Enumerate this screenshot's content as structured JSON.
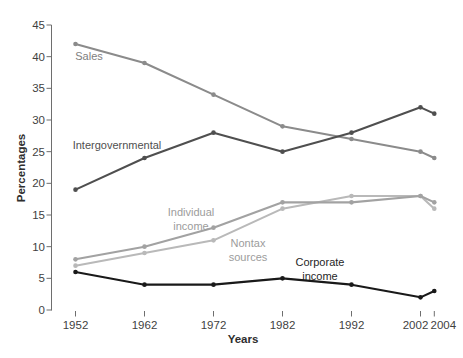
{
  "figure": {
    "background_color": "#ffffff",
    "width_px": 463,
    "height_px": 358
  },
  "chart_data": {
    "type": "line",
    "title": "",
    "xlabel": "Years",
    "ylabel": "Percentages",
    "x": [
      1952,
      1962,
      1972,
      1982,
      1992,
      2002,
      2004
    ],
    "x_tick_labels": [
      "1952",
      "1962",
      "1972",
      "1982",
      "1992",
      "2002",
      "2004"
    ],
    "x_label_dx": [
      0,
      0,
      0,
      0,
      0,
      -5,
      9
    ],
    "y_tick_labels": [
      "0",
      "5",
      "10",
      "15",
      "20",
      "25",
      "30",
      "35",
      "40",
      "45"
    ],
    "ylim": [
      0,
      45
    ],
    "ytick_step": 5,
    "grid": false,
    "legend_position": "inline-labels",
    "marker": "dot",
    "series": [
      {
        "name": "Sales",
        "values": [
          42,
          39,
          34,
          29,
          27,
          25,
          24
        ],
        "color": "#8b8b8b"
      },
      {
        "name": "Nontax sources",
        "values": [
          7,
          9,
          11,
          16,
          18,
          18,
          16
        ],
        "color": "#b9b9b9"
      },
      {
        "name": "Individual income",
        "values": [
          8,
          10,
          13,
          17,
          17,
          18,
          17
        ],
        "color": "#a2a2a2"
      },
      {
        "name": "Intergovernmental",
        "values": [
          19,
          24,
          28,
          25,
          28,
          32,
          31
        ],
        "color": "#4f4f4f"
      },
      {
        "name": "Corporate income",
        "values": [
          6,
          4,
          4,
          5,
          4,
          2,
          3
        ],
        "color": "#191919"
      }
    ],
    "annotations": [
      {
        "text": "Sales",
        "x": 89,
        "y": 56,
        "color": "#7e7e7e"
      },
      {
        "text": "Intergovernmental",
        "x": 117,
        "y": 145,
        "color": "#4f4f4f"
      },
      {
        "text": "Individual\nincome",
        "x": 191,
        "y": 212,
        "color": "#9c9c9c"
      },
      {
        "text": "Nontax\nsources",
        "x": 248,
        "y": 243,
        "color": "#9c9c9c"
      },
      {
        "text": "Corporate\nincome",
        "x": 320,
        "y": 262,
        "color": "#1f1f1f"
      }
    ]
  }
}
